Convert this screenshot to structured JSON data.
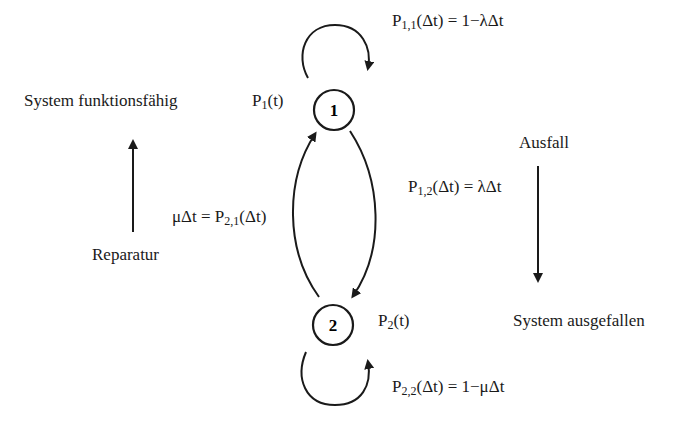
{
  "diagram": {
    "type": "markov-state-transition",
    "nodes": [
      {
        "id": "1",
        "label": "1",
        "state_prob": {
          "symbol": "P",
          "sub": "1",
          "arg": "(t)"
        }
      },
      {
        "id": "2",
        "label": "2",
        "state_prob": {
          "symbol": "P",
          "sub": "2",
          "arg": "(t)"
        }
      }
    ],
    "transitions": {
      "p11": {
        "symbol": "P",
        "sub": "1,1",
        "rest": "(Δt) = 1−λΔt"
      },
      "p12": {
        "symbol": "P",
        "sub": "1,2",
        "rest": "(Δt) = λΔt"
      },
      "p21": {
        "prefix": "μΔt = P",
        "sub": "2,1",
        "rest": "(Δt)"
      },
      "p22": {
        "symbol": "P",
        "sub": "2,2",
        "rest": "(Δt) = 1−μΔt"
      }
    },
    "side_labels": {
      "functional": "System funktionsfähig",
      "repair": "Reparatur",
      "failure": "Ausfall",
      "failed": "System ausgefallen"
    },
    "colors": {
      "stroke": "#1a1a1a",
      "background": "#ffffff"
    }
  }
}
